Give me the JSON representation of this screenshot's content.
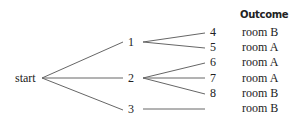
{
  "diagram": {
    "type": "probability-tree",
    "header": "Outcome",
    "root": {
      "label": "start"
    },
    "level1": [
      {
        "label": "1"
      },
      {
        "label": "2"
      },
      {
        "label": "3"
      }
    ],
    "level2": [
      {
        "label": "4",
        "parent": "1"
      },
      {
        "label": "5",
        "parent": "1"
      },
      {
        "label": "6",
        "parent": "2"
      },
      {
        "label": "7",
        "parent": "2"
      },
      {
        "label": "8",
        "parent": "2"
      }
    ],
    "outcomes": [
      "room B",
      "room A",
      "room A",
      "room A",
      "room B",
      "room B"
    ],
    "line_color": "#555555"
  }
}
